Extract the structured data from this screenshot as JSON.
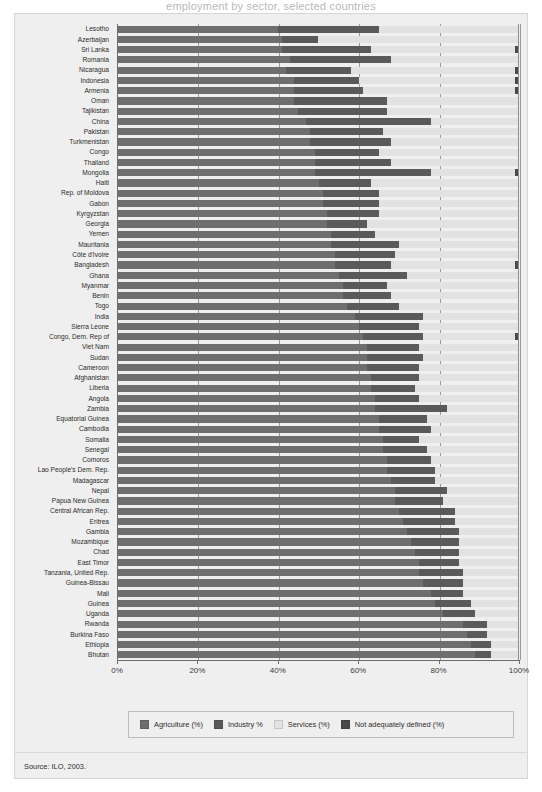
{
  "figure": {
    "clipped_title": "employment by sector, selected countries",
    "source": "Source: ILO, 2003."
  },
  "axis": {
    "ticks": [
      "0%",
      "20%",
      "40%",
      "60%",
      "80%",
      "100%"
    ],
    "tick_values": [
      0,
      20,
      40,
      60,
      80,
      100
    ]
  },
  "legend": {
    "items": [
      {
        "label": "Agriculture (%)",
        "color": "#6e6e6e",
        "key": "agriculture"
      },
      {
        "label": "Industry %",
        "color": "#5a5a5a",
        "key": "industry"
      },
      {
        "label": "Services (%)",
        "color": "#e2e2e2",
        "key": "services"
      },
      {
        "label": "Not adequately defined (%)",
        "color": "#4a4a4a",
        "key": "not_adequately_defined"
      }
    ]
  },
  "chart_data": {
    "type": "bar",
    "orientation": "horizontal",
    "stacked": true,
    "title": "Employment by sector, selected countries",
    "xlabel": "",
    "ylabel": "",
    "xlim": [
      0,
      100
    ],
    "grid": true,
    "legend_position": "bottom",
    "series": [
      {
        "name": "Agriculture (%)",
        "color": "#6e6e6e"
      },
      {
        "name": "Industry %",
        "color": "#5a5a5a"
      },
      {
        "name": "Services (%)",
        "color": "#e2e2e2"
      },
      {
        "name": "Not adequately defined (%)",
        "color": "#4a4a4a"
      }
    ],
    "categories": [
      "Lesotho",
      "Azerbaijan",
      "Sri Lanka",
      "Romania",
      "Nicaragua",
      "Indonesia",
      "Armenia",
      "Oman",
      "Tajikistan",
      "China",
      "Pakistan",
      "Turkmenistan",
      "Congo",
      "Thailand",
      "Mongolia",
      "Haiti",
      "Rep. of Moldova",
      "Gabon",
      "Kyrgyzstan",
      "Georgia",
      "Yemen",
      "Mauritania",
      "Côte d'Ivoire",
      "Bangladesh",
      "Ghana",
      "Myanmar",
      "Benin",
      "Togo",
      "India",
      "Sierra Leone",
      "Congo, Dem. Rep of",
      "Viet Nam",
      "Sudan",
      "Cameroon",
      "Afghanistan",
      "Liberia",
      "Angola",
      "Zambia",
      "Equatorial Guinea",
      "Cambodia",
      "Somalia",
      "Senegal",
      "Comoros",
      "Lao People's Dem. Rep.",
      "Madagascar",
      "Nepal",
      "Papua New Guinea",
      "Central African Rep.",
      "Eritrea",
      "Gambia",
      "Mozambique",
      "Chad",
      "East Timor",
      "Tanzania, United Rep.",
      "Guinea-Bissau",
      "Mali",
      "Guinea",
      "Uganda",
      "Rwanda",
      "Burkina Faso",
      "Ethiopia",
      "Bhutan"
    ],
    "rows": [
      {
        "country": "Lesotho",
        "agriculture": 40,
        "industry": 25,
        "services": 35,
        "not_adequately_defined": 0
      },
      {
        "country": "Azerbaijan",
        "agriculture": 41,
        "industry": 9,
        "services": 50,
        "not_adequately_defined": 0
      },
      {
        "country": "Sri Lanka",
        "agriculture": 41,
        "industry": 22,
        "services": 36,
        "not_adequately_defined": 1
      },
      {
        "country": "Romania",
        "agriculture": 43,
        "industry": 25,
        "services": 32,
        "not_adequately_defined": 0
      },
      {
        "country": "Nicaragua",
        "agriculture": 42,
        "industry": 16,
        "services": 41,
        "not_adequately_defined": 1
      },
      {
        "country": "Indonesia",
        "agriculture": 44,
        "industry": 16,
        "services": 39,
        "not_adequately_defined": 1
      },
      {
        "country": "Armenia",
        "agriculture": 44,
        "industry": 17,
        "services": 38,
        "not_adequately_defined": 1
      },
      {
        "country": "Oman",
        "agriculture": 44,
        "industry": 23,
        "services": 33,
        "not_adequately_defined": 0
      },
      {
        "country": "Tajikistan",
        "agriculture": 45,
        "industry": 22,
        "services": 33,
        "not_adequately_defined": 0
      },
      {
        "country": "China",
        "agriculture": 47,
        "industry": 31,
        "services": 22,
        "not_adequately_defined": 0
      },
      {
        "country": "Pakistan",
        "agriculture": 48,
        "industry": 18,
        "services": 34,
        "not_adequately_defined": 0
      },
      {
        "country": "Turkmenistan",
        "agriculture": 48,
        "industry": 20,
        "services": 32,
        "not_adequately_defined": 0
      },
      {
        "country": "Congo",
        "agriculture": 49,
        "industry": 16,
        "services": 35,
        "not_adequately_defined": 0
      },
      {
        "country": "Thailand",
        "agriculture": 49,
        "industry": 19,
        "services": 32,
        "not_adequately_defined": 0
      },
      {
        "country": "Mongolia",
        "agriculture": 49,
        "industry": 29,
        "services": 21,
        "not_adequately_defined": 1
      },
      {
        "country": "Haiti",
        "agriculture": 50,
        "industry": 13,
        "services": 37,
        "not_adequately_defined": 0
      },
      {
        "country": "Rep. of Moldova",
        "agriculture": 51,
        "industry": 14,
        "services": 35,
        "not_adequately_defined": 0
      },
      {
        "country": "Gabon",
        "agriculture": 51,
        "industry": 14,
        "services": 35,
        "not_adequately_defined": 0
      },
      {
        "country": "Kyrgyzstan",
        "agriculture": 52,
        "industry": 13,
        "services": 35,
        "not_adequately_defined": 0
      },
      {
        "country": "Georgia",
        "agriculture": 52,
        "industry": 10,
        "services": 38,
        "not_adequately_defined": 0
      },
      {
        "country": "Yemen",
        "agriculture": 53,
        "industry": 11,
        "services": 36,
        "not_adequately_defined": 0
      },
      {
        "country": "Mauritania",
        "agriculture": 53,
        "industry": 17,
        "services": 30,
        "not_adequately_defined": 0
      },
      {
        "country": "Côte d'Ivoire",
        "agriculture": 54,
        "industry": 15,
        "services": 31,
        "not_adequately_defined": 0
      },
      {
        "country": "Bangladesh",
        "agriculture": 54,
        "industry": 14,
        "services": 31,
        "not_adequately_defined": 1
      },
      {
        "country": "Ghana",
        "agriculture": 55,
        "industry": 17,
        "services": 28,
        "not_adequately_defined": 0
      },
      {
        "country": "Myanmar",
        "agriculture": 56,
        "industry": 11,
        "services": 33,
        "not_adequately_defined": 0
      },
      {
        "country": "Benin",
        "agriculture": 56,
        "industry": 12,
        "services": 32,
        "not_adequately_defined": 0
      },
      {
        "country": "Togo",
        "agriculture": 57,
        "industry": 13,
        "services": 30,
        "not_adequately_defined": 0
      },
      {
        "country": "India",
        "agriculture": 59,
        "industry": 17,
        "services": 24,
        "not_adequately_defined": 0
      },
      {
        "country": "Sierra Leone",
        "agriculture": 60,
        "industry": 15,
        "services": 25,
        "not_adequately_defined": 0
      },
      {
        "country": "Congo, Dem. Rep of",
        "agriculture": 61,
        "industry": 15,
        "services": 23,
        "not_adequately_defined": 1
      },
      {
        "country": "Viet Nam",
        "agriculture": 62,
        "industry": 13,
        "services": 25,
        "not_adequately_defined": 0
      },
      {
        "country": "Sudan",
        "agriculture": 62,
        "industry": 14,
        "services": 24,
        "not_adequately_defined": 0
      },
      {
        "country": "Cameroon",
        "agriculture": 62,
        "industry": 13,
        "services": 25,
        "not_adequately_defined": 0
      },
      {
        "country": "Afghanistan",
        "agriculture": 63,
        "industry": 12,
        "services": 25,
        "not_adequately_defined": 0
      },
      {
        "country": "Liberia",
        "agriculture": 63,
        "industry": 11,
        "services": 26,
        "not_adequately_defined": 0
      },
      {
        "country": "Angola",
        "agriculture": 64,
        "industry": 11,
        "services": 25,
        "not_adequately_defined": 0
      },
      {
        "country": "Zambia",
        "agriculture": 64,
        "industry": 18,
        "services": 18,
        "not_adequately_defined": 0
      },
      {
        "country": "Equatorial Guinea",
        "agriculture": 65,
        "industry": 12,
        "services": 23,
        "not_adequately_defined": 0
      },
      {
        "country": "Cambodia",
        "agriculture": 65,
        "industry": 13,
        "services": 22,
        "not_adequately_defined": 0
      },
      {
        "country": "Somalia",
        "agriculture": 66,
        "industry": 9,
        "services": 25,
        "not_adequately_defined": 0
      },
      {
        "country": "Senegal",
        "agriculture": 66,
        "industry": 11,
        "services": 23,
        "not_adequately_defined": 0
      },
      {
        "country": "Comoros",
        "agriculture": 67,
        "industry": 11,
        "services": 22,
        "not_adequately_defined": 0
      },
      {
        "country": "Lao People's Dem. Rep.",
        "agriculture": 67,
        "industry": 12,
        "services": 21,
        "not_adequately_defined": 0
      },
      {
        "country": "Madagascar",
        "agriculture": 68,
        "industry": 11,
        "services": 21,
        "not_adequately_defined": 0
      },
      {
        "country": "Nepal",
        "agriculture": 69,
        "industry": 13,
        "services": 18,
        "not_adequately_defined": 0
      },
      {
        "country": "Papua New Guinea",
        "agriculture": 69,
        "industry": 12,
        "services": 19,
        "not_adequately_defined": 0
      },
      {
        "country": "Central African Rep.",
        "agriculture": 70,
        "industry": 14,
        "services": 16,
        "not_adequately_defined": 0
      },
      {
        "country": "Eritrea",
        "agriculture": 71,
        "industry": 13,
        "services": 16,
        "not_adequately_defined": 0
      },
      {
        "country": "Gambia",
        "agriculture": 72,
        "industry": 13,
        "services": 15,
        "not_adequately_defined": 0
      },
      {
        "country": "Mozambique",
        "agriculture": 73,
        "industry": 12,
        "services": 15,
        "not_adequately_defined": 0
      },
      {
        "country": "Chad",
        "agriculture": 74,
        "industry": 11,
        "services": 15,
        "not_adequately_defined": 0
      },
      {
        "country": "East Timor",
        "agriculture": 75,
        "industry": 10,
        "services": 15,
        "not_adequately_defined": 0
      },
      {
        "country": "Tanzania, United Rep.",
        "agriculture": 75,
        "industry": 11,
        "services": 14,
        "not_adequately_defined": 0
      },
      {
        "country": "Guinea-Bissau",
        "agriculture": 76,
        "industry": 10,
        "services": 14,
        "not_adequately_defined": 0
      },
      {
        "country": "Mali",
        "agriculture": 78,
        "industry": 8,
        "services": 14,
        "not_adequately_defined": 0
      },
      {
        "country": "Guinea",
        "agriculture": 79,
        "industry": 9,
        "services": 12,
        "not_adequately_defined": 0
      },
      {
        "country": "Uganda",
        "agriculture": 81,
        "industry": 8,
        "services": 11,
        "not_adequately_defined": 0
      },
      {
        "country": "Rwanda",
        "agriculture": 86,
        "industry": 6,
        "services": 8,
        "not_adequately_defined": 0
      },
      {
        "country": "Burkina Faso",
        "agriculture": 87,
        "industry": 5,
        "services": 8,
        "not_adequately_defined": 0
      },
      {
        "country": "Ethiopia",
        "agriculture": 88,
        "industry": 5,
        "services": 7,
        "not_adequately_defined": 0
      },
      {
        "country": "Bhutan",
        "agriculture": 89,
        "industry": 4,
        "services": 7,
        "not_adequately_defined": 0
      }
    ]
  }
}
